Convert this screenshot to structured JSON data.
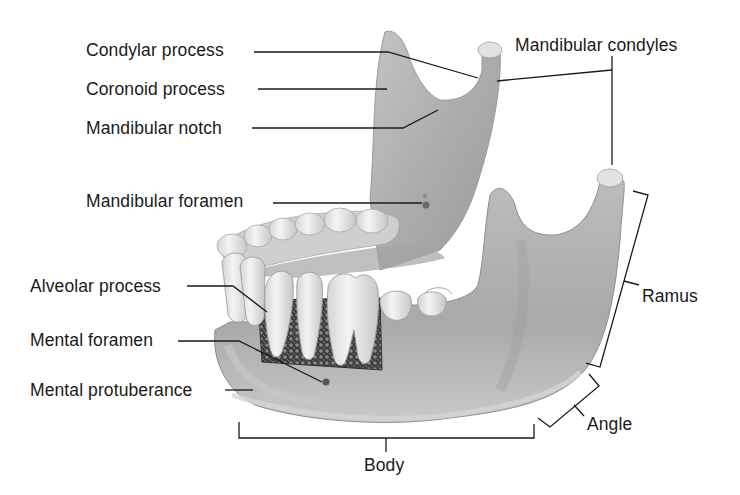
{
  "figure": {
    "colors": {
      "bone": "#b4b4b4",
      "bone_shadow": "#8e8e8e",
      "bone_highlight": "#d6d6d6",
      "tooth": "#ececec",
      "tooth_shadow": "#bdbdbd",
      "spongy_bone": "#4a4a4a",
      "leader_line": "#1a1a1a",
      "background": "#ffffff"
    }
  },
  "labels": {
    "condylar_process": "Condylar process",
    "coronoid_process": "Coronoid process",
    "mandibular_notch": "Mandibular notch",
    "mandibular_foramen": "Mandibular foramen",
    "alveolar_process": "Alveolar process",
    "mental_foramen": "Mental foramen",
    "mental_protuberance": "Mental protuberance",
    "mandibular_condyles": "Mandibular condyles",
    "ramus": "Ramus",
    "angle": "Angle",
    "body": "Body"
  }
}
